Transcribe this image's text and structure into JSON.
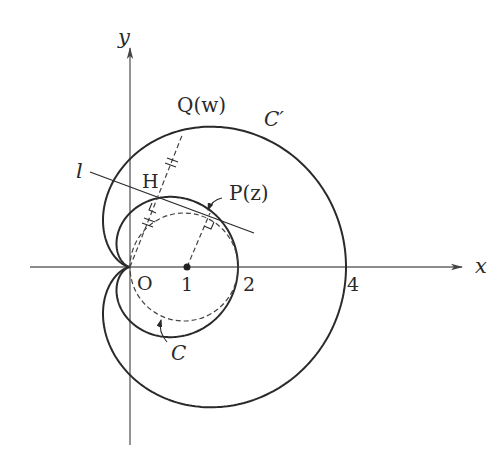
{
  "diagram": {
    "axes": {
      "x_label": "x",
      "y_label": "y",
      "origin_label": "O",
      "ticks": [
        "1",
        "2",
        "4"
      ]
    },
    "curves": {
      "outer_label": "C′",
      "inner_circle_label": "C",
      "line_label": "l"
    },
    "points": {
      "Q": "Q(w)",
      "P": "P(z)",
      "H": "H"
    },
    "colors": {
      "stroke": "#2a2a2a",
      "axis": "#555555",
      "background": "#ffffff"
    },
    "geometry": {
      "origin_px": [
        130,
        267
      ],
      "unit_px": 54
    }
  }
}
